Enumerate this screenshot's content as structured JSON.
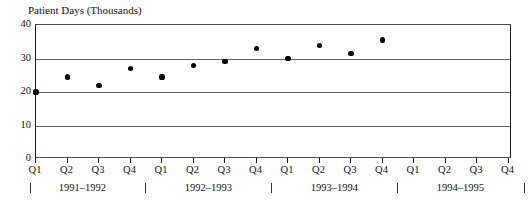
{
  "chart_data": {
    "type": "scatter",
    "title": "Patient Days (Thousands)",
    "xlabel": "",
    "ylabel": "Patient Days (Thousands)",
    "ylim": [
      0,
      40
    ],
    "yticks": [
      0,
      10,
      20,
      30,
      40
    ],
    "ytick_labels": [
      "0",
      "10",
      "20",
      "30",
      "40"
    ],
    "grid": "horizontal",
    "legend": "none",
    "categories": [
      "Q1",
      "Q2",
      "Q3",
      "Q4",
      "Q1",
      "Q2",
      "Q3",
      "Q4",
      "Q1",
      "Q2",
      "Q3",
      "Q4",
      "Q1",
      "Q2",
      "Q3",
      "Q4"
    ],
    "values": [
      20,
      24.5,
      22,
      27,
      24.5,
      28,
      29,
      33,
      30,
      34,
      31.5,
      35.5,
      null,
      null,
      null,
      null
    ],
    "points": [
      {
        "quarter": "Q1",
        "year": "1991–1992",
        "value": 20
      },
      {
        "quarter": "Q2",
        "year": "1991–1992",
        "value": 24.5
      },
      {
        "quarter": "Q3",
        "year": "1991–1992",
        "value": 22
      },
      {
        "quarter": "Q4",
        "year": "1991–1992",
        "value": 27
      },
      {
        "quarter": "Q1",
        "year": "1992–1993",
        "value": 24.5
      },
      {
        "quarter": "Q2",
        "year": "1992–1993",
        "value": 28
      },
      {
        "quarter": "Q3",
        "year": "1992–1993",
        "value": 29
      },
      {
        "quarter": "Q4",
        "year": "1992–1993",
        "value": 33
      },
      {
        "quarter": "Q1",
        "year": "1993–1994",
        "value": 30
      },
      {
        "quarter": "Q2",
        "year": "1993–1994",
        "value": 34
      },
      {
        "quarter": "Q3",
        "year": "1993–1994",
        "value": 31.5
      },
      {
        "quarter": "Q4",
        "year": "1993–1994",
        "value": 35.5
      }
    ],
    "year_groups": [
      "1991–1992",
      "1992–1993",
      "1993–1994",
      "1994–1995"
    ],
    "colors": {
      "point": "#000000",
      "gridline": "#636363",
      "axis": "#1a1a1a",
      "background": "#ffffff",
      "text": "#111111"
    }
  }
}
